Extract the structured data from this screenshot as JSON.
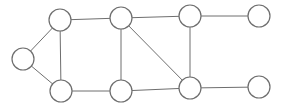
{
  "diagram": {
    "type": "undirected-graph",
    "node_radius": 11,
    "colors": {
      "stroke": "#6e6e6e",
      "fill": "#ffffff",
      "background": "#ffffff"
    },
    "nodes": [
      {
        "id": "A",
        "x": 23,
        "y": 59
      },
      {
        "id": "B",
        "x": 60,
        "y": 20
      },
      {
        "id": "C",
        "x": 61,
        "y": 91
      },
      {
        "id": "D",
        "x": 121,
        "y": 18
      },
      {
        "id": "E",
        "x": 121,
        "y": 91
      },
      {
        "id": "F",
        "x": 190,
        "y": 16
      },
      {
        "id": "G",
        "x": 190,
        "y": 88
      },
      {
        "id": "H",
        "x": 259,
        "y": 16
      },
      {
        "id": "I",
        "x": 259,
        "y": 87
      }
    ],
    "edges": [
      [
        "A",
        "B"
      ],
      [
        "A",
        "C"
      ],
      [
        "B",
        "C"
      ],
      [
        "B",
        "D"
      ],
      [
        "C",
        "E"
      ],
      [
        "D",
        "E"
      ],
      [
        "D",
        "G"
      ],
      [
        "D",
        "F"
      ],
      [
        "E",
        "G"
      ],
      [
        "F",
        "G"
      ],
      [
        "F",
        "H"
      ],
      [
        "G",
        "I"
      ]
    ]
  }
}
